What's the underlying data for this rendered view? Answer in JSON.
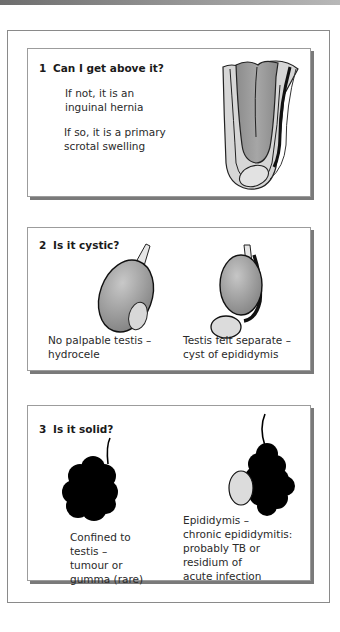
{
  "panels": [
    {
      "number": "1",
      "question": "Can I get above it?",
      "texts": [
        "If not, it is an\ninguinal hernia",
        "If so, it is a primary\nscrotal swelling"
      ],
      "figure": "inguinal-hernia-illustration"
    },
    {
      "number": "2",
      "question": "Is it cystic?",
      "captions": [
        "No palpable testis –\nhydrocele",
        "Testis felt separate –\ncyst of epididymis"
      ],
      "figures": [
        "hydrocele-illustration",
        "epididymal-cyst-illustration"
      ]
    },
    {
      "number": "3",
      "question": "Is it solid?",
      "captions": [
        "Confined to\ntestis –\ntumour or\ngumma (rare)",
        "Epididymis –\nchronic epididymitis:\nprobably TB or\nresidium of\nacute infection"
      ],
      "figures": [
        "testicular-tumour-illustration",
        "chronic-epididymitis-illustration"
      ]
    }
  ],
  "colors": {
    "panel_border": "#9c9c9c",
    "panel_shadow": "#7a7a7a",
    "solid_mass": "#000000",
    "cyst_fill": "#d9d9d9",
    "testis_fill": "#a8a8a8"
  }
}
